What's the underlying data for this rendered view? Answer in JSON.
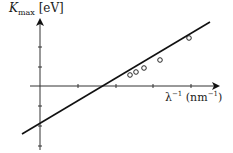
{
  "chart_data": {
    "type": "scatter",
    "title": "",
    "xlabel": "λ^-1 (nm^-1)",
    "ylabel": "K_max (eV)",
    "ylabel_parts": {
      "symbol": "K",
      "subscript": "max",
      "unit": "[eV]"
    },
    "xlabel_parts": {
      "symbol": "λ",
      "exp": "−1",
      "unit_open": " (nm",
      "unit_exp": "−1",
      "unit_close": ")"
    },
    "grid": false,
    "legend": null,
    "axes": {
      "origin_px": [
        40,
        86
      ],
      "x_ticks_px": [
        78,
        116,
        153,
        191
      ],
      "y_ticks_px": [
        47,
        67,
        106,
        126,
        146
      ],
      "x_axis_end_px": 218,
      "y_axis_top_px": 20,
      "y_axis_bottom_px": 150
    },
    "points_px": [
      [
        130,
        75
      ],
      [
        136,
        72
      ],
      [
        144,
        68
      ],
      [
        160,
        60
      ],
      [
        189,
        38
      ]
    ],
    "fit_line_px": {
      "x1": 22,
      "y1": 134,
      "x2": 210,
      "y2": 22
    },
    "series": [
      {
        "name": "measured",
        "marker": "open-circle",
        "x": [
          2.4,
          2.55,
          2.75,
          3.15,
          3.9
        ],
        "y": [
          0.55,
          0.7,
          0.9,
          1.3,
          2.4
        ]
      },
      {
        "name": "linear fit",
        "style": "solid-line",
        "slope_note": "line crosses y-axis below origin (negative intercept = -work function)"
      }
    ],
    "annotations": [
      "x-intercept ≈ threshold frequency",
      "y-intercept negative"
    ]
  },
  "colors": {
    "ink": "#1a1a1a",
    "axis": "#333333",
    "background": "#ffffff"
  }
}
